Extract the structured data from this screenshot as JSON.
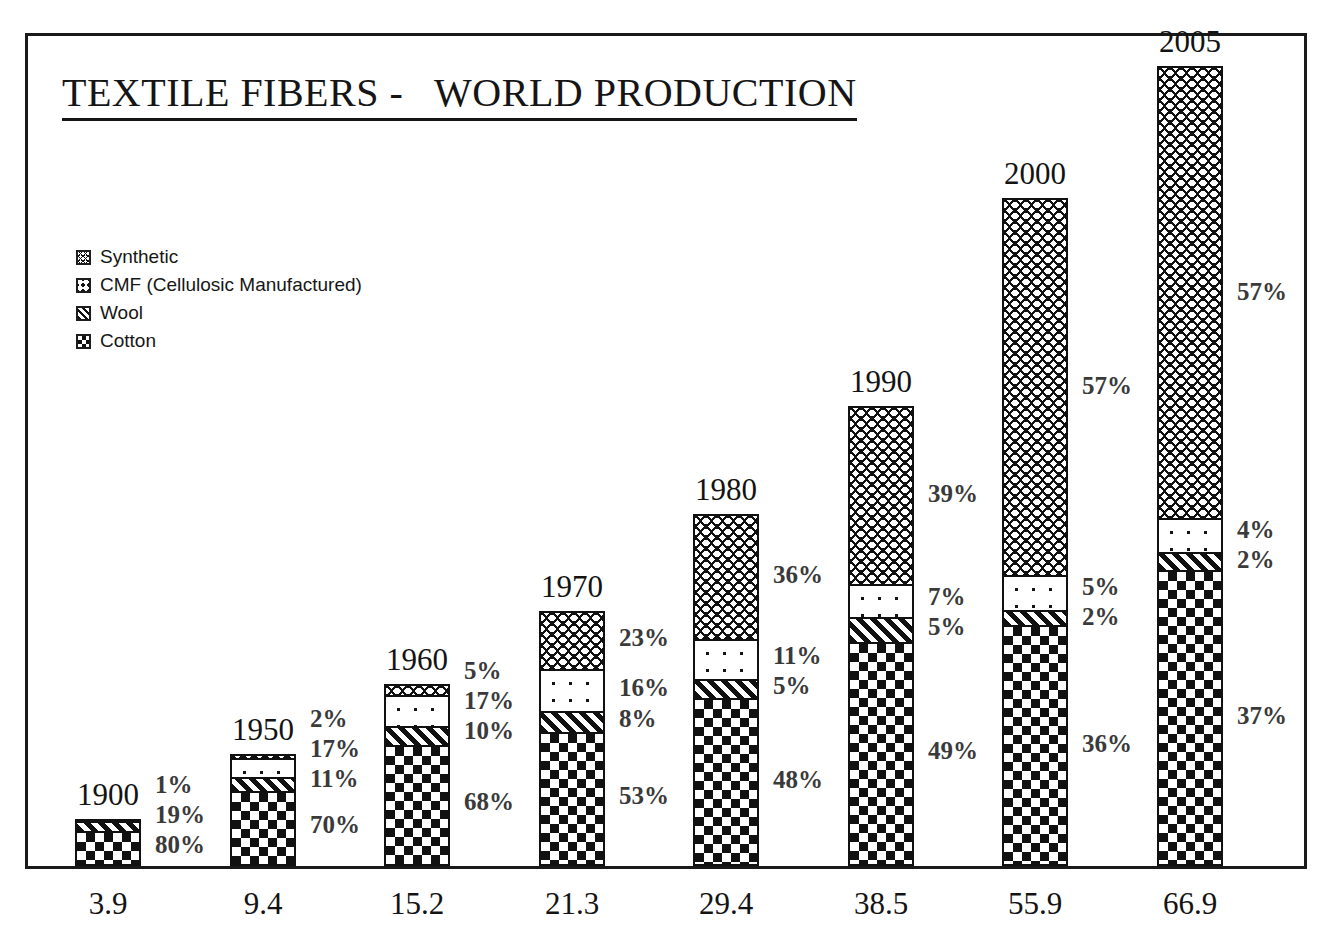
{
  "chart": {
    "title": "TEXTILE FIBERS -   WORLD PRODUCTION"
  },
  "legend": {
    "position": "upper-left",
    "items": [
      {
        "label": "Synthetic",
        "marker": "synthetic-swatch",
        "pattern": "zigzag"
      },
      {
        "label": "CMF (Cellulosic Manufactured)",
        "marker": "cmf-swatch",
        "pattern": "dots"
      },
      {
        "label": "Wool",
        "marker": "wool-swatch",
        "pattern": "diagonal-hatch"
      },
      {
        "label": "Cotton",
        "marker": "cotton-swatch",
        "pattern": "checkerboard"
      }
    ]
  },
  "chart_data": {
    "type": "bar",
    "subtype": "stacked-vertical-100pct-scaled-by-total",
    "title": "TEXTILE FIBERS -   WORLD PRODUCTION",
    "xlabel": "",
    "ylabel": "",
    "grid": false,
    "legend_position": "upper-left",
    "categories": [
      "1900",
      "1950",
      "1960",
      "1970",
      "1980",
      "1990",
      "2000",
      "2005"
    ],
    "totals": [
      3.9,
      9.4,
      15.2,
      21.3,
      29.4,
      38.5,
      55.9,
      66.9
    ],
    "total_labels": [
      "3.9",
      "9.4",
      "15.2",
      "21.3",
      "29.4",
      "38.5",
      "55.9",
      "66.9"
    ],
    "series": [
      {
        "name": "Cotton",
        "values": [
          80,
          70,
          68,
          53,
          48,
          49,
          36,
          37
        ],
        "labels": [
          "80%",
          "70%",
          "68%",
          "53%",
          "48%",
          "49%",
          "36%",
          "37%"
        ]
      },
      {
        "name": "Wool",
        "values": [
          19,
          11,
          10,
          8,
          5,
          5,
          2,
          2
        ],
        "labels": [
          "19%",
          "11%",
          "10%",
          "8%",
          "5%",
          "5%",
          "2%",
          "2%"
        ]
      },
      {
        "name": "CMF (Cellulosic Manufactured)",
        "values": [
          1,
          17,
          17,
          16,
          11,
          7,
          5,
          4
        ],
        "labels": [
          "1%",
          "17%",
          "17%",
          "16%",
          "11%",
          "7%",
          "5%",
          "4%"
        ]
      },
      {
        "name": "Synthetic",
        "values": [
          0,
          2,
          5,
          23,
          36,
          39,
          57,
          57
        ],
        "labels": [
          "",
          "2%",
          "5%",
          "23%",
          "36%",
          "39%",
          "57%",
          "57%"
        ]
      }
    ]
  },
  "bars": [
    {
      "year": "1900",
      "total": "3.9",
      "segments": [
        {
          "name": "Synthetic",
          "pct": "",
          "share": 0,
          "pattern": "synthetic"
        },
        {
          "name": "CMF",
          "pct": "1%",
          "share": 1,
          "pattern": "cmf"
        },
        {
          "name": "Wool",
          "pct": "19%",
          "share": 19,
          "pattern": "wool"
        },
        {
          "name": "Cotton",
          "pct": "80%",
          "share": 80,
          "pattern": "cotton"
        }
      ]
    },
    {
      "year": "1950",
      "total": "9.4",
      "segments": [
        {
          "name": "Synthetic",
          "pct": "2%",
          "share": 2,
          "pattern": "synthetic"
        },
        {
          "name": "CMF",
          "pct": "17%",
          "share": 17,
          "pattern": "cmf"
        },
        {
          "name": "Wool",
          "pct": "11%",
          "share": 11,
          "pattern": "wool"
        },
        {
          "name": "Cotton",
          "pct": "70%",
          "share": 70,
          "pattern": "cotton"
        }
      ]
    },
    {
      "year": "1960",
      "total": "15.2",
      "segments": [
        {
          "name": "Synthetic",
          "pct": "5%",
          "share": 5,
          "pattern": "synthetic"
        },
        {
          "name": "CMF",
          "pct": "17%",
          "share": 17,
          "pattern": "cmf"
        },
        {
          "name": "Wool",
          "pct": "10%",
          "share": 10,
          "pattern": "wool"
        },
        {
          "name": "Cotton",
          "pct": "68%",
          "share": 68,
          "pattern": "cotton"
        }
      ]
    },
    {
      "year": "1970",
      "total": "21.3",
      "segments": [
        {
          "name": "Synthetic",
          "pct": "23%",
          "share": 23,
          "pattern": "synthetic"
        },
        {
          "name": "CMF",
          "pct": "16%",
          "share": 16,
          "pattern": "cmf"
        },
        {
          "name": "Wool",
          "pct": "8%",
          "share": 8,
          "pattern": "wool"
        },
        {
          "name": "Cotton",
          "pct": "53%",
          "share": 53,
          "pattern": "cotton"
        }
      ]
    },
    {
      "year": "1980",
      "total": "29.4",
      "segments": [
        {
          "name": "Synthetic",
          "pct": "36%",
          "share": 36,
          "pattern": "synthetic"
        },
        {
          "name": "CMF",
          "pct": "11%",
          "share": 11,
          "pattern": "cmf"
        },
        {
          "name": "Wool",
          "pct": "5%",
          "share": 5,
          "pattern": "wool"
        },
        {
          "name": "Cotton",
          "pct": "48%",
          "share": 48,
          "pattern": "cotton"
        }
      ]
    },
    {
      "year": "1990",
      "total": "38.5",
      "segments": [
        {
          "name": "Synthetic",
          "pct": "39%",
          "share": 39,
          "pattern": "synthetic"
        },
        {
          "name": "CMF",
          "pct": "7%",
          "share": 7,
          "pattern": "cmf"
        },
        {
          "name": "Wool",
          "pct": "5%",
          "share": 5,
          "pattern": "wool"
        },
        {
          "name": "Cotton",
          "pct": "49%",
          "share": 49,
          "pattern": "cotton"
        }
      ]
    },
    {
      "year": "2000",
      "total": "55.9",
      "segments": [
        {
          "name": "Synthetic",
          "pct": "57%",
          "share": 57,
          "pattern": "synthetic"
        },
        {
          "name": "CMF",
          "pct": "5%",
          "share": 5,
          "pattern": "cmf"
        },
        {
          "name": "Wool",
          "pct": "2%",
          "share": 2,
          "pattern": "wool"
        },
        {
          "name": "Cotton",
          "pct": "36%",
          "share": 36,
          "pattern": "cotton"
        }
      ]
    },
    {
      "year": "2005",
      "total": "66.9",
      "segments": [
        {
          "name": "Synthetic",
          "pct": "57%",
          "share": 57,
          "pattern": "synthetic"
        },
        {
          "name": "CMF",
          "pct": "4%",
          "share": 4,
          "pattern": "cmf"
        },
        {
          "name": "Wool",
          "pct": "2%",
          "share": 2,
          "pattern": "wool"
        },
        {
          "name": "Cotton",
          "pct": "37%",
          "share": 37,
          "pattern": "cotton"
        }
      ]
    }
  ],
  "colors": {
    "ink": "#111111",
    "paper": "#ffffff",
    "label_gray": "#3a3a3a"
  }
}
